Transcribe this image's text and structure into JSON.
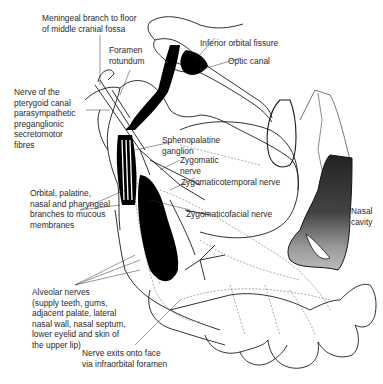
{
  "diagram": {
    "labels": {
      "meningeal": "Meningeal branch to floor\nof middle cranial fossa",
      "foramen_rotundum": "Foramen\nrotundum",
      "inferior_orbital_fissure": "Inferior orbital fissure",
      "optic_canal": "Optic canal",
      "pterygoid_canal": "Nerve of the\npterygoid canal\nparasympathetic\npreganglionic\nsecretomotor\nfibres",
      "sphenopalatine": "Sphenopalatine\nganglion",
      "zygomatic_nerve": "Zygomatic\nnerve",
      "zygomaticotemporal": "Zygomaticotemporal nerve",
      "orbital_palatine": "Orbital, palatine,\nnasal and pharyngeal\nbranches to mucous\nmembranes",
      "zygomaticofacial": "Zygomaticofacial nerve",
      "nasal_cavity": "Nasal\ncavity",
      "alveolar": "Alveolar nerves\n(supply teeth, gums,\nadjacent palate, lateral\nnasal wall, nasal septum,\nlower eyelid and skin of\nthe upper lip)",
      "infraorbital": "Nerve exits onto face\nvia infraorbital foramen"
    },
    "colors": {
      "ink": "#1a1a1a",
      "nerve_fill": "#000000",
      "dashed": "#888888",
      "nasal_dark": "#333333",
      "nasal_light": "#bdbdbd"
    }
  }
}
